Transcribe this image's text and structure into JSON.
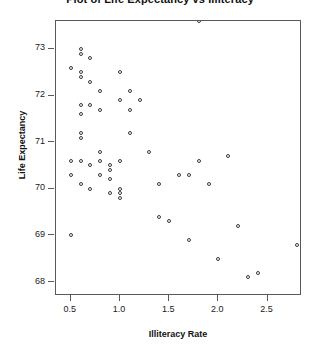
{
  "chart_data": {
    "type": "scatter",
    "title": "Plot of Life Expectancy vs Illiteracy",
    "xlabel": "Illiteracy Rate",
    "ylabel": "Life Expectancy",
    "xlim": [
      0.35,
      2.85
    ],
    "ylim": [
      67.7,
      73.6
    ],
    "xticks": [
      0.5,
      1.0,
      1.5,
      2.0,
      2.5
    ],
    "xtick_labels": [
      "0.5",
      "1.0",
      "1.5",
      "2.0",
      "2.5"
    ],
    "yticks": [
      68,
      69,
      70,
      71,
      72,
      73
    ],
    "ytick_labels": [
      "68",
      "69",
      "70",
      "71",
      "72",
      "73"
    ],
    "grid": false,
    "legend": false,
    "marker": "open-circle",
    "marker_color": "#3a3a3a",
    "points": [
      {
        "x": 0.5,
        "y": 72.6
      },
      {
        "x": 0.5,
        "y": 70.6
      },
      {
        "x": 0.5,
        "y": 70.3
      },
      {
        "x": 0.5,
        "y": 69.0
      },
      {
        "x": 0.6,
        "y": 73.0
      },
      {
        "x": 0.6,
        "y": 72.9
      },
      {
        "x": 0.6,
        "y": 72.5
      },
      {
        "x": 0.6,
        "y": 72.4
      },
      {
        "x": 0.6,
        "y": 71.8
      },
      {
        "x": 0.6,
        "y": 71.6
      },
      {
        "x": 0.6,
        "y": 71.2
      },
      {
        "x": 0.6,
        "y": 71.1
      },
      {
        "x": 0.6,
        "y": 70.6
      },
      {
        "x": 0.6,
        "y": 70.1
      },
      {
        "x": 0.7,
        "y": 72.8
      },
      {
        "x": 0.7,
        "y": 72.3
      },
      {
        "x": 0.7,
        "y": 71.8
      },
      {
        "x": 0.7,
        "y": 70.5
      },
      {
        "x": 0.7,
        "y": 70.0
      },
      {
        "x": 0.8,
        "y": 72.1
      },
      {
        "x": 0.8,
        "y": 71.7
      },
      {
        "x": 0.8,
        "y": 70.8
      },
      {
        "x": 0.8,
        "y": 70.6
      },
      {
        "x": 0.8,
        "y": 70.3
      },
      {
        "x": 0.9,
        "y": 70.5
      },
      {
        "x": 0.9,
        "y": 70.4
      },
      {
        "x": 0.9,
        "y": 70.2
      },
      {
        "x": 0.9,
        "y": 69.9
      },
      {
        "x": 1.0,
        "y": 72.5
      },
      {
        "x": 1.0,
        "y": 71.9
      },
      {
        "x": 1.0,
        "y": 70.6
      },
      {
        "x": 1.0,
        "y": 70.0
      },
      {
        "x": 1.0,
        "y": 69.9
      },
      {
        "x": 1.0,
        "y": 69.8
      },
      {
        "x": 1.1,
        "y": 72.1
      },
      {
        "x": 1.1,
        "y": 71.7
      },
      {
        "x": 1.1,
        "y": 71.2
      },
      {
        "x": 1.2,
        "y": 71.9
      },
      {
        "x": 1.3,
        "y": 70.8
      },
      {
        "x": 1.4,
        "y": 70.1
      },
      {
        "x": 1.4,
        "y": 69.4
      },
      {
        "x": 1.5,
        "y": 69.3
      },
      {
        "x": 1.6,
        "y": 70.3
      },
      {
        "x": 1.7,
        "y": 70.3
      },
      {
        "x": 1.7,
        "y": 68.9
      },
      {
        "x": 1.8,
        "y": 70.6
      },
      {
        "x": 1.8,
        "y": 73.6
      },
      {
        "x": 1.9,
        "y": 70.1
      },
      {
        "x": 2.0,
        "y": 68.5
      },
      {
        "x": 2.1,
        "y": 70.7
      },
      {
        "x": 2.2,
        "y": 69.2
      },
      {
        "x": 2.3,
        "y": 68.1
      },
      {
        "x": 2.4,
        "y": 68.2
      },
      {
        "x": 2.8,
        "y": 68.8
      }
    ]
  }
}
